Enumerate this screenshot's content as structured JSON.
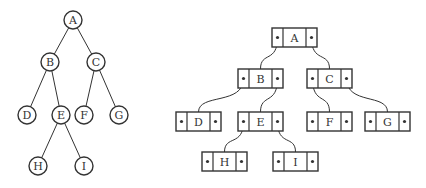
{
  "diagram": {
    "tree": {
      "nodes": [
        {
          "id": "A",
          "label": "A",
          "x": 73,
          "y": 20
        },
        {
          "id": "B",
          "label": "B",
          "x": 50,
          "y": 62
        },
        {
          "id": "C",
          "label": "C",
          "x": 96,
          "y": 62
        },
        {
          "id": "D",
          "label": "D",
          "x": 27,
          "y": 115
        },
        {
          "id": "E",
          "label": "E",
          "x": 61,
          "y": 115
        },
        {
          "id": "F",
          "label": "F",
          "x": 84,
          "y": 115
        },
        {
          "id": "G",
          "label": "G",
          "x": 119,
          "y": 115
        },
        {
          "id": "H",
          "label": "H",
          "x": 38,
          "y": 166
        },
        {
          "id": "I",
          "label": "I",
          "x": 84,
          "y": 166
        }
      ],
      "edges": [
        [
          "A",
          "B"
        ],
        [
          "A",
          "C"
        ],
        [
          "B",
          "D"
        ],
        [
          "B",
          "E"
        ],
        [
          "C",
          "F"
        ],
        [
          "C",
          "G"
        ],
        [
          "E",
          "H"
        ],
        [
          "E",
          "I"
        ]
      ]
    },
    "linked": {
      "nodes": [
        {
          "id": "A",
          "label": "A",
          "x": 272,
          "y": 28
        },
        {
          "id": "B",
          "label": "B",
          "x": 238,
          "y": 69
        },
        {
          "id": "C",
          "label": "C",
          "x": 307,
          "y": 69
        },
        {
          "id": "D",
          "label": "D",
          "x": 176,
          "y": 112
        },
        {
          "id": "E",
          "label": "E",
          "x": 238,
          "y": 112
        },
        {
          "id": "F",
          "label": "F",
          "x": 307,
          "y": 112
        },
        {
          "id": "G",
          "label": "G",
          "x": 365,
          "y": 112
        },
        {
          "id": "H",
          "label": "H",
          "x": 202,
          "y": 152
        },
        {
          "id": "I",
          "label": "I",
          "x": 273,
          "y": 152
        }
      ],
      "edges": [
        {
          "from": "A",
          "side": "left",
          "to": "B"
        },
        {
          "from": "A",
          "side": "right",
          "to": "C"
        },
        {
          "from": "B",
          "side": "left",
          "to": "D"
        },
        {
          "from": "B",
          "side": "right",
          "to": "E"
        },
        {
          "from": "C",
          "side": "left",
          "to": "F"
        },
        {
          "from": "C",
          "side": "right",
          "to": "G"
        },
        {
          "from": "E",
          "side": "left",
          "to": "H"
        },
        {
          "from": "E",
          "side": "right",
          "to": "I"
        }
      ]
    }
  }
}
